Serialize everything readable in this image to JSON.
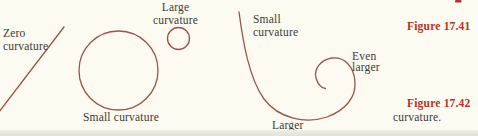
{
  "colors": {
    "background": "#fcfaf1",
    "curve_stroke": "#9b544a",
    "caption_red": "#b2332b",
    "label_text": "#3e3a33",
    "page_edge": "#e5e2da"
  },
  "figure_41": {
    "caption": "Figure 17.41",
    "zero_label": {
      "line1": "Zero",
      "line2": "curvature"
    },
    "small_label": "Small curvature",
    "large_label": {
      "line1": "Large",
      "line2": "curvature"
    }
  },
  "figure_42": {
    "caption": "Figure 17.42",
    "caption_continuation": "curvature.",
    "small_label": {
      "line1": "Small",
      "line2": "curvature"
    },
    "larger_label": "Larger",
    "even_larger_label": {
      "line1": "Even",
      "line2": "larger"
    }
  }
}
